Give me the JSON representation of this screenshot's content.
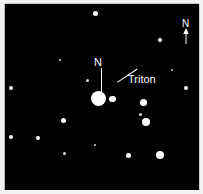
{
  "figure": {
    "background_color": "#010101",
    "margin_color": "#f2f2f2",
    "star_color": "#ffffff",
    "label_color": "#ffffff"
  },
  "labels": {
    "neptune_north": "N",
    "triton": "Triton",
    "compass_north": "N"
  },
  "icons": {
    "compass_arrow": "north-arrow-icon"
  },
  "objects": {
    "neptune": {
      "name": "Neptune",
      "x": 99,
      "y": 100,
      "size": 15
    },
    "triton": {
      "name": "Triton",
      "x": 112,
      "y": 99,
      "size": 7
    }
  },
  "stars": [
    {
      "x": 95,
      "y": 13,
      "size": 5
    },
    {
      "x": 160,
      "y": 40,
      "size": 4
    },
    {
      "x": 186,
      "y": 88,
      "size": 4
    },
    {
      "x": 11,
      "y": 88,
      "size": 4
    },
    {
      "x": 11,
      "y": 137,
      "size": 4
    },
    {
      "x": 87,
      "y": 80,
      "size": 3
    },
    {
      "x": 143,
      "y": 102,
      "size": 7
    },
    {
      "x": 140,
      "y": 114,
      "size": 3
    },
    {
      "x": 146,
      "y": 122,
      "size": 8
    },
    {
      "x": 63,
      "y": 120,
      "size": 5
    },
    {
      "x": 38,
      "y": 138,
      "size": 4
    },
    {
      "x": 128,
      "y": 155,
      "size": 5
    },
    {
      "x": 160,
      "y": 155,
      "size": 8
    },
    {
      "x": 64,
      "y": 153,
      "size": 3
    },
    {
      "x": 95,
      "y": 145,
      "size": 2
    },
    {
      "x": 172,
      "y": 70,
      "size": 2
    },
    {
      "x": 60,
      "y": 60,
      "size": 2
    }
  ]
}
